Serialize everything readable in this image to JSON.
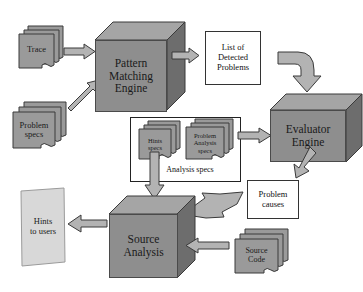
{
  "diagram": {
    "colors": {
      "box_fill": "#8e8e8e",
      "box_top": "#a5a5a5",
      "box_side": "#6d6d6d",
      "doc_fill": "#9a9a9a",
      "arrow_fill": "#b3b3b3",
      "page_fill": "#d8d8d8",
      "outline": "#3a3a3a",
      "background": "#ffffff"
    },
    "engines": [
      {
        "id": "pattern-matching-engine",
        "lines": [
          "Pattern",
          "Matching",
          "Engine"
        ]
      },
      {
        "id": "evaluator-engine",
        "lines": [
          "Evaluator",
          "Engine"
        ]
      },
      {
        "id": "source-analysis",
        "lines": [
          "Source",
          "Analysis"
        ]
      }
    ],
    "documents": [
      {
        "id": "trace",
        "lines": [
          "Trace"
        ]
      },
      {
        "id": "problem-specs",
        "lines": [
          "Problem",
          "specs"
        ]
      },
      {
        "id": "hints-specs",
        "lines": [
          "Hints",
          "specs"
        ]
      },
      {
        "id": "problem-analysis-specs",
        "lines": [
          "Problem",
          "Analysis",
          "specs"
        ]
      },
      {
        "id": "source-code",
        "lines": [
          "Source",
          "Code"
        ]
      }
    ],
    "boxes": [
      {
        "id": "list-of-detected-problems",
        "lines": [
          "List of",
          "Detected",
          "Problems"
        ]
      },
      {
        "id": "problem-causes",
        "lines": [
          "Problem",
          "causes"
        ]
      }
    ],
    "group": {
      "id": "analysis-specs-group",
      "label": "Analysis specs"
    },
    "page": {
      "id": "hints-to-users",
      "lines": [
        "Hints",
        "to users"
      ]
    },
    "arrows": [
      {
        "id": "trace-to-pattern-matching",
        "kind": "straight-right"
      },
      {
        "id": "problem-specs-to-pattern-matching",
        "kind": "diagonal-up-right"
      },
      {
        "id": "pattern-matching-to-list",
        "kind": "straight-right"
      },
      {
        "id": "list-to-evaluator",
        "kind": "elbow-down"
      },
      {
        "id": "analysis-specs-to-evaluator",
        "kind": "straight-right"
      },
      {
        "id": "evaluator-to-problem-causes",
        "kind": "diagonal-down-left"
      },
      {
        "id": "problem-causes-to-source-analysis",
        "kind": "diagonal-left"
      },
      {
        "id": "source-code-to-source-analysis",
        "kind": "straight-left"
      },
      {
        "id": "hints-specs-to-source-analysis",
        "kind": "straight-down"
      },
      {
        "id": "source-analysis-to-hints",
        "kind": "straight-left"
      }
    ]
  }
}
